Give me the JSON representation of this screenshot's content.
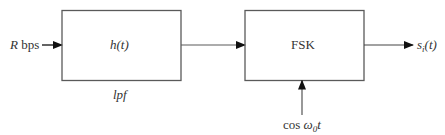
{
  "diagram": {
    "type": "block-diagram",
    "colors": {
      "stroke": "#5a5a5a",
      "arrow": "#111111",
      "text": "#333333",
      "background": "#ffffff"
    },
    "input": {
      "label_var": "R",
      "label_unit": " bps"
    },
    "blocks": [
      {
        "id": "lpf",
        "label": "h(t)",
        "caption": "lpf"
      },
      {
        "id": "fsk",
        "label": "FSK"
      }
    ],
    "carrier": {
      "prefix": "cos ",
      "omega": "ω",
      "sub": "0",
      "suffix": "t"
    },
    "output": {
      "base": "s",
      "sub": "i",
      "arg": "(t)"
    },
    "edges": [
      {
        "from": "input",
        "to": "lpf"
      },
      {
        "from": "lpf",
        "to": "fsk"
      },
      {
        "from": "carrier",
        "to": "fsk"
      },
      {
        "from": "fsk",
        "to": "output"
      }
    ]
  }
}
